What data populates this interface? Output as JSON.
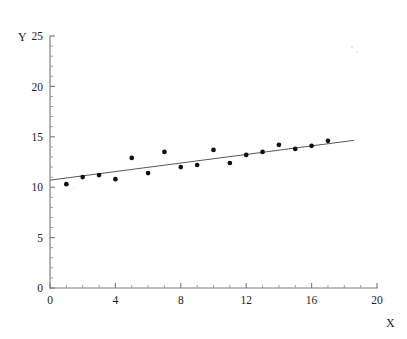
{
  "figure": {
    "kind": "scatter-plot-with-regression-line",
    "background_color": "#ffffff",
    "point_color": "#111111",
    "line_color": "#444444",
    "axis_color": "#7d7d7d"
  },
  "axis_titles": {
    "x": "X",
    "y": "Y"
  },
  "x_ticks": [
    "0",
    "4",
    "8",
    "12",
    "16",
    "20"
  ],
  "y_ticks": [
    "0",
    "5",
    "10",
    "15",
    "20",
    "25"
  ],
  "chart_data": {
    "type": "scatter",
    "title": "",
    "subtitle": "",
    "xlabel": "X",
    "ylabel": "Y",
    "xlim": [
      0,
      20
    ],
    "ylim": [
      0,
      25
    ],
    "xtick_values": [
      0,
      4,
      8,
      12,
      16,
      20
    ],
    "ytick_values": [
      0,
      5,
      10,
      15,
      20,
      25
    ],
    "x_minor_tick_step": 1,
    "y_minor_tick_step": 1,
    "grid": false,
    "legend": false,
    "legend_position": "none",
    "annotations": [],
    "series": [
      {
        "name": "observations",
        "type": "scatter",
        "marker": "filled-circle",
        "color": "#111111",
        "x": [
          1,
          2,
          3,
          4,
          5,
          6,
          7,
          8,
          9,
          10,
          11,
          12,
          13,
          14,
          15,
          16,
          17
        ],
        "y": [
          10.3,
          11.0,
          11.2,
          10.8,
          12.9,
          11.4,
          13.5,
          12.0,
          12.2,
          13.7,
          12.4,
          13.2,
          13.5,
          14.2,
          13.8,
          14.1,
          14.6
        ]
      },
      {
        "name": "fitted regression line",
        "type": "line",
        "color": "#444444",
        "x": [
          0.0,
          18.6
        ],
        "y": [
          10.7,
          14.65
        ],
        "intercept": 10.7,
        "slope": 0.212
      }
    ]
  }
}
